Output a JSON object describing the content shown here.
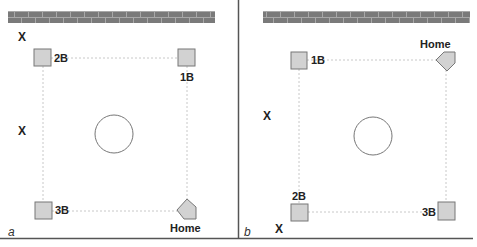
{
  "colors": {
    "base_fill": "#d2d2d2",
    "base_stroke": "#777777",
    "path_line": "#c8c8c8",
    "wall": "#7a7a7a",
    "wall_mortar": "#a8a8a8",
    "border": "#555555",
    "circle": "#777777"
  },
  "panels": [
    {
      "letter": "a",
      "bases": {
        "second": {
          "label": "2B"
        },
        "first": {
          "label": "1B"
        },
        "third": {
          "label": "3B"
        },
        "home": {
          "label": "Home"
        }
      },
      "markers": [
        {
          "label": "X"
        },
        {
          "label": "X"
        }
      ]
    },
    {
      "letter": "b",
      "bases": {
        "first": {
          "label": "1B"
        },
        "home": {
          "label": "Home"
        },
        "second": {
          "label": "2B"
        },
        "third": {
          "label": "3B"
        }
      },
      "markers": [
        {
          "label": "X"
        },
        {
          "label": "X"
        }
      ]
    }
  ]
}
